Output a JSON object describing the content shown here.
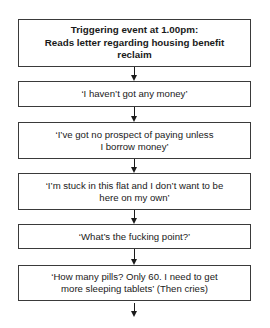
{
  "flowchart": {
    "steps": [
      {
        "line1": "Triggering event at 1.00pm:",
        "line2": "Reads letter regarding housing benefit reclaim",
        "style": "bold"
      },
      {
        "text": "‘I haven’t got any money’"
      },
      {
        "text": "‘I’ve got no prospect of paying unless I borrow money’"
      },
      {
        "text": "‘I’m stuck in this flat and I don’t want to be here on my own’"
      },
      {
        "text": "‘What’s the fucking point?’"
      },
      {
        "text": "‘How many pills? Only 60. I need to get more sleeping tablets’ (Then cries)"
      }
    ],
    "arrows": [
      "down-arrow",
      "down-arrow",
      "down-arrow",
      "down-arrow",
      "down-arrow",
      "down-arrow"
    ],
    "colors": {
      "border": "#3a3a3a",
      "arrow": "#1a1a1a",
      "background": "#ffffff"
    }
  }
}
